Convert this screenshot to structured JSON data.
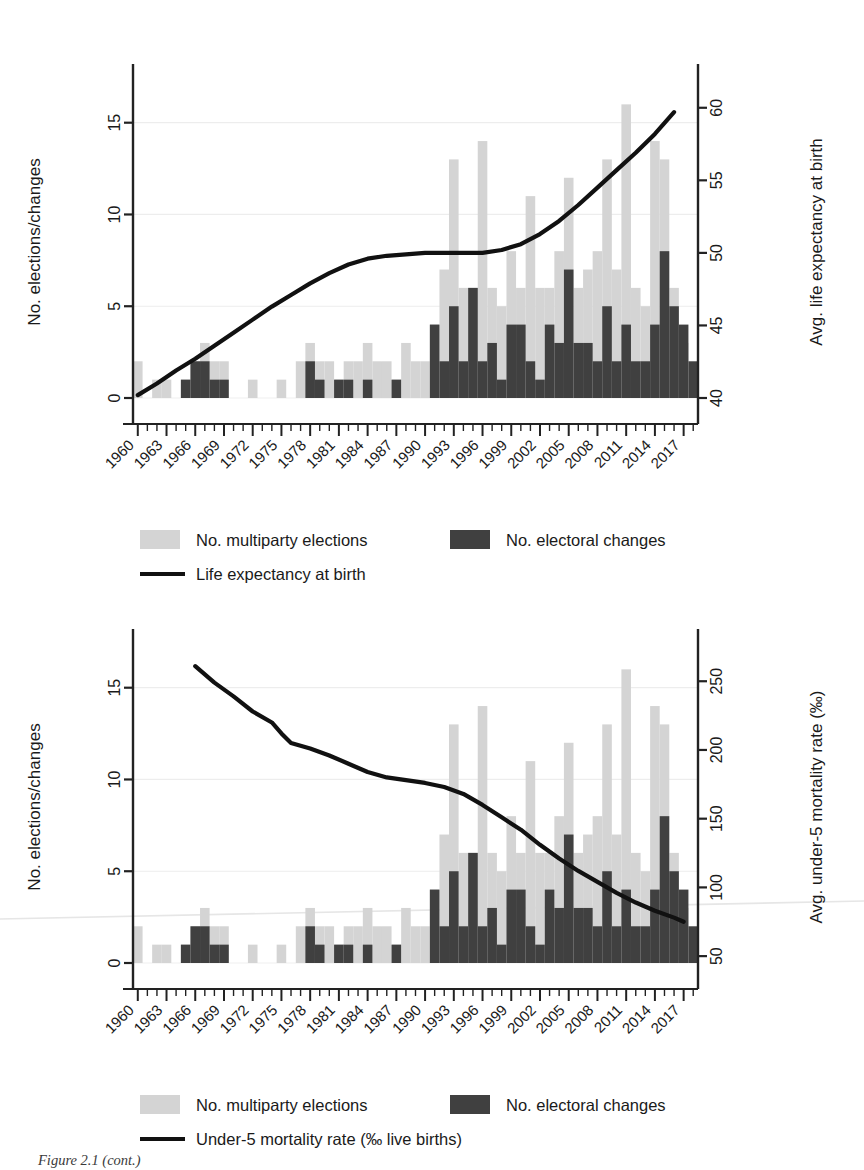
{
  "figure": {
    "caption": "Figure 2.1 (cont.)"
  },
  "chart_data": [
    {
      "id": "top",
      "type": "bar",
      "title": "",
      "xlabel": "",
      "ylabel": "No. elections/changes",
      "ylabel_right": "Avg. life expectancy at birth",
      "ylim": [
        0,
        17
      ],
      "yticks": [
        0,
        5,
        10,
        15
      ],
      "ylim_right": [
        40,
        61.5
      ],
      "yticks_right": [
        40,
        45,
        50,
        55,
        60
      ],
      "grid": true,
      "legend_position": "bottom",
      "x": [
        1960,
        1961,
        1962,
        1963,
        1964,
        1965,
        1966,
        1967,
        1968,
        1969,
        1970,
        1971,
        1972,
        1973,
        1974,
        1975,
        1976,
        1977,
        1978,
        1979,
        1980,
        1981,
        1982,
        1983,
        1984,
        1985,
        1986,
        1987,
        1988,
        1989,
        1990,
        1991,
        1992,
        1993,
        1994,
        1995,
        1996,
        1997,
        1998,
        1999,
        2000,
        2001,
        2002,
        2003,
        2004,
        2005,
        2006,
        2007,
        2008,
        2009,
        2010,
        2011,
        2012,
        2013,
        2014,
        2015,
        2016,
        2017,
        2018
      ],
      "xticks": [
        1960,
        1963,
        1966,
        1969,
        1972,
        1975,
        1978,
        1981,
        1984,
        1987,
        1990,
        1993,
        1996,
        1999,
        2002,
        2005,
        2008,
        2011,
        2014,
        2017
      ],
      "series": [
        {
          "name": "No. multiparty elections",
          "color": "#d4d4d4",
          "values": [
            2,
            0,
            1,
            1,
            0,
            1,
            2,
            3,
            2,
            2,
            0,
            0,
            1,
            0,
            0,
            1,
            0,
            2,
            3,
            2,
            2,
            1,
            2,
            2,
            3,
            2,
            2,
            1,
            3,
            2,
            2,
            4,
            7,
            13,
            6,
            6,
            14,
            6,
            5,
            8,
            6,
            11,
            6,
            6,
            8,
            12,
            6,
            7,
            8,
            13,
            7,
            16,
            6,
            5,
            14,
            13,
            6,
            3,
            0
          ]
        },
        {
          "name": "No. electoral changes",
          "color": "#404040",
          "values": [
            0,
            0,
            0,
            0,
            0,
            1,
            2,
            2,
            1,
            1,
            0,
            0,
            0,
            0,
            0,
            0,
            0,
            0,
            2,
            1,
            0,
            1,
            1,
            0,
            1,
            0,
            0,
            1,
            0,
            0,
            0,
            4,
            2,
            5,
            2,
            6,
            2,
            3,
            1,
            4,
            4,
            2,
            1,
            4,
            3,
            7,
            3,
            3,
            2,
            5,
            2,
            4,
            2,
            2,
            4,
            8,
            5,
            4,
            2
          ]
        }
      ],
      "line_series": {
        "name": "Life expectancy at birth",
        "color": "#111111",
        "axis": "right",
        "x": [
          1960,
          1962,
          1964,
          1966,
          1968,
          1970,
          1972,
          1974,
          1976,
          1978,
          1980,
          1982,
          1984,
          1986,
          1988,
          1990,
          1992,
          1994,
          1996,
          1998,
          2000,
          2002,
          2004,
          2006,
          2008,
          2010,
          2012,
          2014,
          2016
        ],
        "values": [
          40.2,
          41.0,
          41.9,
          42.7,
          43.6,
          44.5,
          45.4,
          46.3,
          47.1,
          47.9,
          48.6,
          49.2,
          49.6,
          49.8,
          49.9,
          50.0,
          50.0,
          50.0,
          50.0,
          50.2,
          50.6,
          51.3,
          52.2,
          53.3,
          54.5,
          55.7,
          56.9,
          58.2,
          59.7
        ]
      }
    },
    {
      "id": "bottom",
      "type": "bar",
      "title": "",
      "xlabel": "",
      "ylabel": "No. elections/changes",
      "ylabel_right": "Avg. under-5 mortality rate (‰)",
      "ylim": [
        0,
        17
      ],
      "yticks": [
        0,
        5,
        10,
        15
      ],
      "ylim_right": [
        45,
        272
      ],
      "yticks_right": [
        50,
        100,
        150,
        200,
        250
      ],
      "grid": true,
      "legend_position": "bottom",
      "x": [
        1960,
        1961,
        1962,
        1963,
        1964,
        1965,
        1966,
        1967,
        1968,
        1969,
        1970,
        1971,
        1972,
        1973,
        1974,
        1975,
        1976,
        1977,
        1978,
        1979,
        1980,
        1981,
        1982,
        1983,
        1984,
        1985,
        1986,
        1987,
        1988,
        1989,
        1990,
        1991,
        1992,
        1993,
        1994,
        1995,
        1996,
        1997,
        1998,
        1999,
        2000,
        2001,
        2002,
        2003,
        2004,
        2005,
        2006,
        2007,
        2008,
        2009,
        2010,
        2011,
        2012,
        2013,
        2014,
        2015,
        2016,
        2017,
        2018
      ],
      "xticks": [
        1960,
        1963,
        1966,
        1969,
        1972,
        1975,
        1978,
        1981,
        1984,
        1987,
        1990,
        1993,
        1996,
        1999,
        2002,
        2005,
        2008,
        2011,
        2014,
        2017
      ],
      "series": [
        {
          "name": "No. multiparty elections",
          "color": "#d4d4d4",
          "values": [
            2,
            0,
            1,
            1,
            0,
            1,
            2,
            3,
            2,
            2,
            0,
            0,
            1,
            0,
            0,
            1,
            0,
            2,
            3,
            2,
            2,
            1,
            2,
            2,
            3,
            2,
            2,
            1,
            3,
            2,
            2,
            4,
            7,
            13,
            6,
            6,
            14,
            6,
            5,
            8,
            6,
            11,
            6,
            6,
            8,
            12,
            6,
            7,
            8,
            13,
            7,
            16,
            6,
            5,
            14,
            13,
            6,
            3,
            0
          ]
        },
        {
          "name": "No. electoral changes",
          "color": "#404040",
          "values": [
            0,
            0,
            0,
            0,
            0,
            1,
            2,
            2,
            1,
            1,
            0,
            0,
            0,
            0,
            0,
            0,
            0,
            0,
            2,
            1,
            0,
            1,
            1,
            0,
            1,
            0,
            0,
            1,
            0,
            0,
            0,
            4,
            2,
            5,
            2,
            6,
            2,
            3,
            1,
            4,
            4,
            2,
            1,
            4,
            3,
            7,
            3,
            3,
            2,
            5,
            2,
            4,
            2,
            2,
            4,
            8,
            5,
            4,
            2
          ]
        }
      ],
      "line_series": {
        "name": "Under-5 mortality rate (‰ live births)",
        "color": "#111111",
        "axis": "right",
        "x": [
          1966,
          1968,
          1970,
          1972,
          1974,
          1975,
          1976,
          1978,
          1980,
          1982,
          1984,
          1986,
          1988,
          1990,
          1992,
          1994,
          1996,
          1998,
          2000,
          2002,
          2004,
          2006,
          2008,
          2010,
          2012,
          2014,
          2016,
          2017
        ],
        "values": [
          261,
          249,
          239,
          228,
          220,
          212,
          205,
          201,
          196,
          190,
          184,
          180,
          178,
          176,
          173,
          168,
          160,
          151,
          142,
          131,
          121,
          112,
          104,
          96,
          89,
          83,
          78,
          75
        ]
      }
    }
  ],
  "panels": [
    {
      "left_axis_title": "No. elections/changes",
      "right_axis_title": "Avg. life expectancy at birth",
      "y_left_ticks": [
        "0",
        "5",
        "10",
        "15"
      ],
      "y_right_ticks": [
        "40",
        "45",
        "50",
        "55",
        "60"
      ],
      "x_ticks": [
        "1960",
        "1963",
        "1966",
        "1969",
        "1972",
        "1975",
        "1978",
        "1981",
        "1984",
        "1987",
        "1990",
        "1993",
        "1996",
        "1999",
        "2002",
        "2005",
        "2008",
        "2011",
        "2014",
        "2017"
      ],
      "legend": [
        {
          "label": "No. multiparty elections",
          "swatch": "light-gray-swatch",
          "color": "#d4d4d4",
          "type": "box"
        },
        {
          "label": "No. electoral changes",
          "swatch": "dark-gray-swatch",
          "color": "#404040",
          "type": "box"
        },
        {
          "label": "Life expectancy at birth",
          "swatch": "black-line-swatch",
          "color": "#111111",
          "type": "line"
        }
      ]
    },
    {
      "left_axis_title": "No. elections/changes",
      "right_axis_title": "Avg. under-5 mortality rate (‰)",
      "y_left_ticks": [
        "0",
        "5",
        "10",
        "15"
      ],
      "y_right_ticks": [
        "50",
        "100",
        "150",
        "200",
        "250"
      ],
      "x_ticks": [
        "1960",
        "1963",
        "1966",
        "1969",
        "1972",
        "1975",
        "1978",
        "1981",
        "1984",
        "1987",
        "1990",
        "1993",
        "1996",
        "1999",
        "2002",
        "2005",
        "2008",
        "2011",
        "2014",
        "2017"
      ],
      "legend": [
        {
          "label": "No. multiparty elections",
          "swatch": "light-gray-swatch",
          "color": "#d4d4d4",
          "type": "box"
        },
        {
          "label": "No. electoral changes",
          "swatch": "dark-gray-swatch",
          "color": "#404040",
          "type": "box"
        },
        {
          "label": "Under-5 mortality rate (‰ live births)",
          "swatch": "black-line-swatch",
          "color": "#111111",
          "type": "line"
        }
      ]
    }
  ]
}
